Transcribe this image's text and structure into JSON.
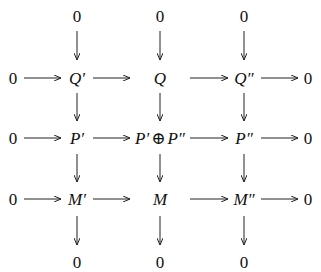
{
  "diagram": {
    "type": "commutative-diagram",
    "top_zeros": [
      "0",
      "0",
      "0"
    ],
    "rows": [
      {
        "left": "0",
        "nodes": [
          "Q′",
          "Q",
          "Q″"
        ],
        "right": "0"
      },
      {
        "left": "0",
        "nodes": [
          "P′",
          "P′ ⊕ P″",
          "P″"
        ],
        "right": "0"
      },
      {
        "left": "0",
        "nodes": [
          "M′",
          "M",
          "M″"
        ],
        "right": "0"
      }
    ],
    "bottom_zeros": [
      "0",
      "0",
      "0"
    ],
    "p_middle": {
      "a": "P′",
      "op": "⊕",
      "b": "P″"
    }
  }
}
